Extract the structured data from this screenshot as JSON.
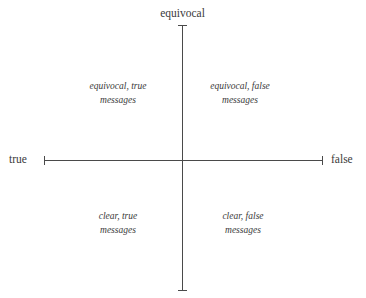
{
  "figure": {
    "type": "two-axis-quadrant-diagram",
    "background_color": "#ffffff",
    "line_color": "#4a4a4a",
    "text_color": "#3a3a3a"
  },
  "axes": {
    "vertical": {
      "top_label": "equivocal",
      "bottom_label": ""
    },
    "horizontal": {
      "left_label": "true",
      "right_label": "false"
    }
  },
  "quadrants": {
    "top_left": "equivocal, true\nmessages",
    "top_right": "equivocal, false\nmessages",
    "bottom_left": "clear, true\nmessages",
    "bottom_right": "clear, false\nmessages"
  },
  "chart_data": {
    "type": "scatter",
    "title": "",
    "xlabel": "",
    "ylabel": "",
    "x_axis": {
      "left_end_label": "true",
      "right_end_label": "false",
      "ticks": [
        "true",
        "false"
      ]
    },
    "y_axis": {
      "top_end_label": "equivocal",
      "bottom_end_label": "",
      "ticks": [
        "equivocal"
      ]
    },
    "grid": false,
    "legend": "none",
    "annotations": [
      {
        "quadrant": "top-left",
        "text": "equivocal, true messages"
      },
      {
        "quadrant": "top-right",
        "text": "equivocal, false messages"
      },
      {
        "quadrant": "bottom-left",
        "text": "clear, true messages"
      },
      {
        "quadrant": "bottom-right",
        "text": "clear, false messages"
      }
    ],
    "series": []
  }
}
